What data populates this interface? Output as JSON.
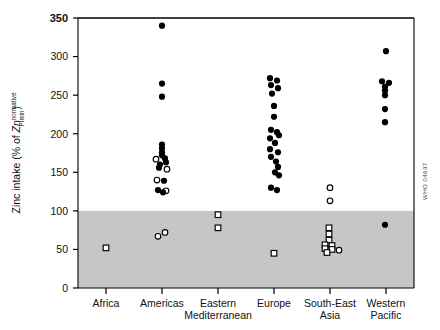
{
  "credit": "WHO 04637",
  "chart_data": {
    "type": "scatter",
    "title": "",
    "xlabel": "",
    "ylabel": "Zinc intake (% of Zn normative PImin)",
    "ylabel_parts": {
      "prefix": "Zinc intake (% of ",
      "italic": "Zn",
      "superscript": "normative",
      "subscript": "PImin",
      "suffix": ")"
    },
    "ylim": [
      0,
      350
    ],
    "yticks": [
      0,
      50,
      100,
      150,
      200,
      250,
      300,
      350
    ],
    "ytick_labels": [
      "0",
      "50",
      "100",
      "150",
      "200",
      "250",
      "300",
      "350"
    ],
    "grid": false,
    "legend": "none",
    "shaded_band": {
      "from": 0,
      "to": 100,
      "color": "#c6c6c6",
      "description": "Region below 100% of normative requirement"
    },
    "categories": [
      "Africa",
      "Americas",
      "Eastern Mediterranean",
      "Europe",
      "South-East Asia",
      "Western Pacific"
    ],
    "category_label_lines": [
      [
        "Africa"
      ],
      [
        "Americas"
      ],
      [
        "Eastern",
        "Mediterranean"
      ],
      [
        "Europe"
      ],
      [
        "South-East",
        "Asia"
      ],
      [
        "Western",
        "Pacific"
      ]
    ],
    "marker_types": [
      "filled-circle",
      "open-circle",
      "open-square"
    ],
    "series": [
      {
        "name": "Africa",
        "category_index": 0,
        "points": [
          {
            "value": 52,
            "marker": "open-square",
            "offset": 0
          }
        ]
      },
      {
        "name": "Americas",
        "category_index": 1,
        "points": [
          {
            "value": 340,
            "marker": "filled-circle",
            "offset": 0
          },
          {
            "value": 265,
            "marker": "filled-circle",
            "offset": 0
          },
          {
            "value": 248,
            "marker": "filled-circle",
            "offset": 0
          },
          {
            "value": 186,
            "marker": "filled-circle",
            "offset": 0
          },
          {
            "value": 181,
            "marker": "filled-circle",
            "offset": 0
          },
          {
            "value": 176,
            "marker": "filled-circle",
            "offset": 0
          },
          {
            "value": 172,
            "marker": "filled-circle",
            "offset": 0
          },
          {
            "value": 168,
            "marker": "filled-circle",
            "offset": 3
          },
          {
            "value": 167,
            "marker": "open-circle",
            "offset": -6
          },
          {
            "value": 163,
            "marker": "filled-circle",
            "offset": 4
          },
          {
            "value": 160,
            "marker": "filled-circle",
            "offset": -2
          },
          {
            "value": 156,
            "marker": "filled-circle",
            "offset": -3
          },
          {
            "value": 154,
            "marker": "open-circle",
            "offset": 5
          },
          {
            "value": 140,
            "marker": "open-circle",
            "offset": -5
          },
          {
            "value": 139,
            "marker": "filled-circle",
            "offset": 2
          },
          {
            "value": 127,
            "marker": "filled-circle",
            "offset": -4
          },
          {
            "value": 126,
            "marker": "open-circle",
            "offset": 4
          },
          {
            "value": 124,
            "marker": "filled-circle",
            "offset": 1
          },
          {
            "value": 72,
            "marker": "open-circle",
            "offset": 3
          },
          {
            "value": 67,
            "marker": "open-circle",
            "offset": -4
          }
        ]
      },
      {
        "name": "Eastern Mediterranean",
        "category_index": 2,
        "points": [
          {
            "value": 95,
            "marker": "open-square",
            "offset": 0
          },
          {
            "value": 78,
            "marker": "open-square",
            "offset": 0
          }
        ]
      },
      {
        "name": "Europe",
        "category_index": 3,
        "points": [
          {
            "value": 272,
            "marker": "filled-circle",
            "offset": -4
          },
          {
            "value": 269,
            "marker": "filled-circle",
            "offset": 3
          },
          {
            "value": 263,
            "marker": "filled-circle",
            "offset": -3
          },
          {
            "value": 259,
            "marker": "filled-circle",
            "offset": 4
          },
          {
            "value": 252,
            "marker": "filled-circle",
            "offset": -2
          },
          {
            "value": 236,
            "marker": "filled-circle",
            "offset": 0
          },
          {
            "value": 222,
            "marker": "filled-circle",
            "offset": 0
          },
          {
            "value": 205,
            "marker": "filled-circle",
            "offset": -3
          },
          {
            "value": 202,
            "marker": "filled-circle",
            "offset": 3
          },
          {
            "value": 198,
            "marker": "filled-circle",
            "offset": 5
          },
          {
            "value": 194,
            "marker": "filled-circle",
            "offset": -4
          },
          {
            "value": 188,
            "marker": "filled-circle",
            "offset": 1
          },
          {
            "value": 180,
            "marker": "filled-circle",
            "offset": -4
          },
          {
            "value": 176,
            "marker": "filled-circle",
            "offset": 4
          },
          {
            "value": 170,
            "marker": "filled-circle",
            "offset": -3
          },
          {
            "value": 164,
            "marker": "filled-circle",
            "offset": 2
          },
          {
            "value": 157,
            "marker": "filled-circle",
            "offset": 4
          },
          {
            "value": 150,
            "marker": "filled-circle",
            "offset": 1
          },
          {
            "value": 146,
            "marker": "filled-circle",
            "offset": 5
          },
          {
            "value": 130,
            "marker": "filled-circle",
            "offset": -3
          },
          {
            "value": 127,
            "marker": "filled-circle",
            "offset": 3
          },
          {
            "value": 45,
            "marker": "open-square",
            "offset": 0
          }
        ]
      },
      {
        "name": "South-East Asia",
        "category_index": 4,
        "points": [
          {
            "value": 130,
            "marker": "open-circle",
            "offset": 0
          },
          {
            "value": 113,
            "marker": "open-circle",
            "offset": 0
          },
          {
            "value": 78,
            "marker": "open-square",
            "offset": -1
          },
          {
            "value": 70,
            "marker": "open-square",
            "offset": -1
          },
          {
            "value": 62,
            "marker": "open-square",
            "offset": -1
          },
          {
            "value": 56,
            "marker": "open-square",
            "offset": -5
          },
          {
            "value": 55,
            "marker": "open-square",
            "offset": 2
          },
          {
            "value": 51,
            "marker": "open-square",
            "offset": -5
          },
          {
            "value": 50,
            "marker": "open-square",
            "offset": 2
          },
          {
            "value": 49,
            "marker": "open-circle",
            "offset": 9
          },
          {
            "value": 46,
            "marker": "open-square",
            "offset": -3
          }
        ]
      },
      {
        "name": "Western Pacific",
        "category_index": 5,
        "points": [
          {
            "value": 307,
            "marker": "filled-circle",
            "offset": 0
          },
          {
            "value": 268,
            "marker": "filled-circle",
            "offset": -4
          },
          {
            "value": 266,
            "marker": "filled-circle",
            "offset": 3
          },
          {
            "value": 261,
            "marker": "filled-circle",
            "offset": -1
          },
          {
            "value": 256,
            "marker": "filled-circle",
            "offset": -1
          },
          {
            "value": 250,
            "marker": "filled-circle",
            "offset": -1
          },
          {
            "value": 232,
            "marker": "filled-circle",
            "offset": -1
          },
          {
            "value": 215,
            "marker": "filled-circle",
            "offset": -1
          },
          {
            "value": 82,
            "marker": "filled-circle",
            "offset": -1
          }
        ]
      }
    ]
  }
}
